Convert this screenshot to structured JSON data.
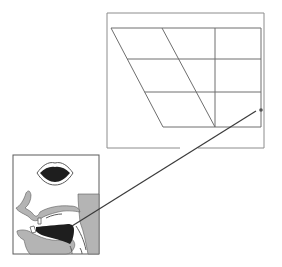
{
  "diagram": {
    "type": "vowel-articulation-diagram",
    "colors": {
      "background": "#ffffff",
      "frame": "#8c8c8c",
      "grid": "#6e6e6e",
      "pointer": "#3a3a3a",
      "dot": "#555555",
      "tissue": "#b4b4b4",
      "tongue": "#1e1e1e",
      "mouth_opening": "#1e1e1e",
      "outline": "#5a5a5a"
    },
    "vowel_chart": {
      "outer_frame": {
        "x": 107,
        "y": 13,
        "w": 157,
        "h": 135,
        "gap_bottom_from": 180,
        "gap_bottom_to": 198
      },
      "grid_rows_y": [
        28,
        59,
        92,
        127
      ],
      "quad": {
        "top_left": [
          111,
          28
        ],
        "top_right": [
          261,
          28
        ],
        "bottom_right": [
          261,
          127
        ],
        "bottom_left": [
          163,
          127
        ]
      },
      "central_diagonal": {
        "from": [
          162,
          28
        ],
        "to": [
          215,
          127
        ]
      },
      "back_vertical_x": 215,
      "highlight_vowel": {
        "x": 261,
        "y": 110,
        "label": "open back vowel position"
      }
    },
    "articulation_panel": {
      "frame": {
        "x": 13,
        "y": 155,
        "w": 86,
        "h": 99
      },
      "lips_view": {
        "cx": 55,
        "cy": 173,
        "rx": 18,
        "ry": 11,
        "rounded": false,
        "opening": "wide"
      },
      "tongue_position": "low back"
    },
    "pointer_line": {
      "from": [
        72,
        226
      ],
      "to": [
        256,
        111
      ]
    }
  }
}
